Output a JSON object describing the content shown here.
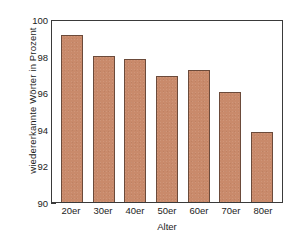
{
  "chart_data": {
    "type": "bar",
    "title": "",
    "xlabel": "Alter",
    "ylabel": "wiedererkannte Wörter in Prozent",
    "categories": [
      "20er",
      "30er",
      "40er",
      "50er",
      "60er",
      "70er",
      "80er"
    ],
    "values": [
      99.1,
      98.0,
      97.8,
      96.9,
      97.2,
      96.0,
      93.8
    ],
    "ylim": [
      90,
      100
    ],
    "yticks": [
      90,
      92,
      94,
      96,
      98,
      100
    ],
    "ytick_labels": [
      "90",
      "92",
      "94",
      "96",
      "98",
      "100"
    ],
    "grid": false,
    "legend": null,
    "bar_color": "#c98a6b",
    "bar_edge_color": "#6b4a3a",
    "axis_color": "#3a3a3a",
    "background": "#ffffff"
  }
}
